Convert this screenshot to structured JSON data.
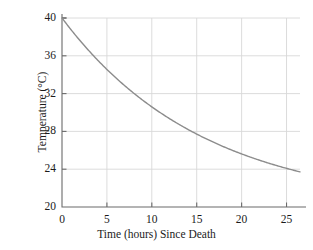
{
  "chart_data": {
    "type": "line",
    "title": "",
    "xlabel": "Time (hours) Since Death",
    "ylabel": "Temperature (°C)",
    "xlim": [
      0,
      26.5
    ],
    "ylim": [
      20,
      40
    ],
    "xticks": [
      0,
      5,
      10,
      15,
      20,
      25
    ],
    "xtick_labels": [
      "0",
      "5",
      "10",
      "15",
      "20",
      "25"
    ],
    "yticks": [
      20,
      24,
      28,
      32,
      36,
      40
    ],
    "ytick_labels": [
      "20",
      "24",
      "28",
      "32",
      "36",
      "40"
    ],
    "grid": true,
    "legend": "none",
    "series": [
      {
        "name": "Body temperature",
        "color": "#8c8c8c",
        "line_width": 1.4,
        "x": [
          0,
          1,
          2,
          3,
          4,
          5,
          6,
          7,
          8,
          9,
          10,
          11,
          12,
          13,
          14,
          15,
          16,
          17,
          18,
          19,
          20,
          21,
          22,
          23,
          24,
          25,
          26,
          26.5
        ],
        "y": [
          40.0,
          38.77,
          37.62,
          36.54,
          35.52,
          34.57,
          33.67,
          32.83,
          32.04,
          31.29,
          30.59,
          29.93,
          29.31,
          28.73,
          28.18,
          29.0,
          27.17,
          26.71,
          26.27,
          25.86,
          25.48,
          25.12,
          24.78,
          24.46,
          24.16,
          23.88,
          23.62,
          23.49
        ]
      }
    ],
    "model": {
      "equation": "T = 20 + 20e^(-0.0635t)",
      "ambient_temperature": 20,
      "initial_temperature": 40,
      "cooling_constant": 0.0635
    },
    "data_points": [
      {
        "t": 0,
        "T": 40.0
      },
      {
        "t": 5,
        "T": 34.6
      },
      {
        "t": 10,
        "T": 30.6
      },
      {
        "t": 15,
        "T": 27.7
      },
      {
        "t": 20,
        "T": 25.5
      },
      {
        "t": 25,
        "T": 23.9
      }
    ]
  },
  "style": {
    "axis_color": "#6b6b6b",
    "grid_color": "#d8d8d8",
    "curve_color": "#8c8c8c",
    "background": "#ffffff",
    "text_color": "#1b1b1b"
  },
  "geometry": {
    "plot_left": 62,
    "plot_right": 300,
    "plot_top": 18,
    "plot_bottom": 207
  }
}
